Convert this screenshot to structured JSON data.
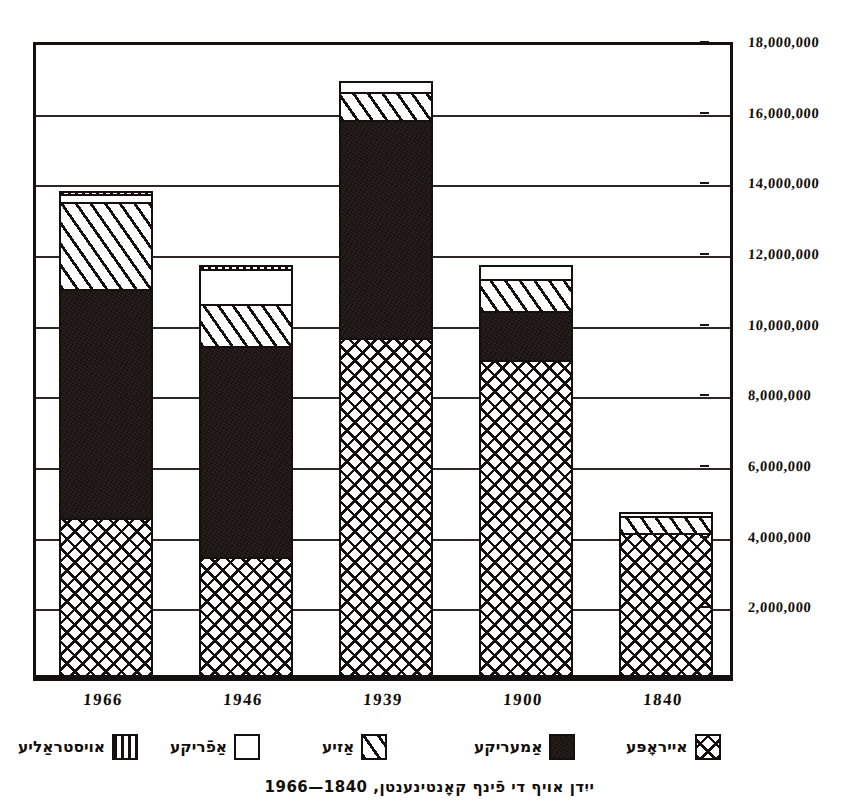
{
  "caption": "ייִדן אויף די פֿינף קאָנטינענטן, 1840—1966",
  "axis": {
    "y_ticks": [
      {
        "label": "18,000,000",
        "value": 18000000
      },
      {
        "label": "16,000,000",
        "value": 16000000
      },
      {
        "label": "14,000,000",
        "value": 14000000
      },
      {
        "label": "12,000,000",
        "value": 12000000
      },
      {
        "label": "10,000,000",
        "value": 10000000
      },
      {
        "label": "8,000,000",
        "value": 8000000
      },
      {
        "label": "6,000,000",
        "value": 6000000
      },
      {
        "label": "4,000,000",
        "value": 4000000
      },
      {
        "label": "2,000,000",
        "value": 2000000
      }
    ],
    "x_ticks": [
      "1966",
      "1946",
      "1939",
      "1900",
      "1840"
    ]
  },
  "legend": {
    "items": [
      {
        "label": "אויסטראַליע",
        "pattern": "vertical-stripes",
        "key": "australia"
      },
      {
        "label": "אַפֿריקע",
        "pattern": "empty-white",
        "key": "africa"
      },
      {
        "label": "אַזיע",
        "pattern": "diagonal-hatch",
        "key": "asia"
      },
      {
        "label": "אַמעריקע",
        "pattern": "solid-black",
        "key": "america"
      },
      {
        "label": "אייראָפּע",
        "pattern": "cross-hatch",
        "key": "europe"
      }
    ]
  },
  "colors": {
    "ink": "#15100d",
    "paper": "#ffffff",
    "solid_fill": "#1e1714"
  },
  "chart_data": {
    "type": "bar",
    "title": "ייִדן אויף די פֿינף קאָנטינענטן, 1840—1966",
    "subtitle": "",
    "xlabel": "",
    "ylabel": "",
    "stacked": true,
    "grid": true,
    "legend_position": "bottom",
    "ylim": [
      0,
      18000000
    ],
    "ytick_step": 2000000,
    "categories": [
      "1966",
      "1946",
      "1939",
      "1900",
      "1840"
    ],
    "series": [
      {
        "name": "אייראָפּע",
        "key": "europe",
        "pattern": "cross-hatch",
        "values": [
          4400000,
          3300000,
          9500000,
          8900000,
          4000000
        ]
      },
      {
        "name": "אַמעריקע",
        "key": "america",
        "pattern": "solid-black",
        "values": [
          6500000,
          6000000,
          6200000,
          1400000,
          0
        ]
      },
      {
        "name": "אַזיע",
        "key": "asia",
        "pattern": "diagonal-hatch",
        "values": [
          2500000,
          1200000,
          800000,
          900000,
          500000
        ]
      },
      {
        "name": "אַפֿריקע",
        "key": "africa",
        "pattern": "empty-white",
        "values": [
          200000,
          1000000,
          300000,
          400000,
          100000
        ]
      },
      {
        "name": "אויסטראַליע",
        "key": "australia",
        "pattern": "vertical-stripes",
        "values": [
          100000,
          100000,
          0,
          0,
          0
        ]
      }
    ],
    "totals": [
      13700000,
      11600000,
      16800000,
      11600000,
      4600000
    ]
  }
}
